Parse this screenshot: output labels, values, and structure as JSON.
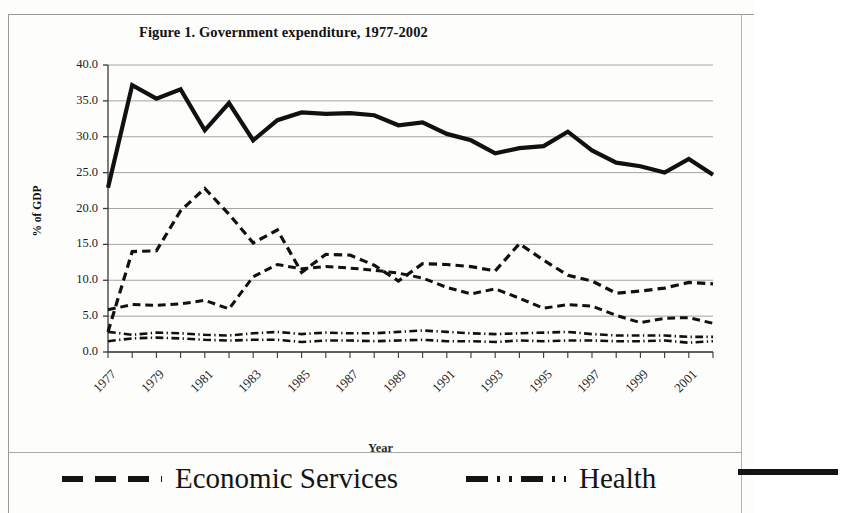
{
  "figure": {
    "title": "Figure 1. Government expenditure, 1977-2002",
    "x_axis_title": "Year",
    "y_axis_title": "% of GDP"
  },
  "legend": {
    "items": [
      {
        "label": "Economic Services",
        "dash_style": "dashed"
      },
      {
        "label": "Health",
        "dash_style": "dash-dot"
      },
      {
        "label": "",
        "dash_style": "solid"
      }
    ]
  },
  "colors": {
    "ink": "#111111",
    "gridline": "#9a9a96",
    "axis": "#3a3a3a",
    "page": "#fdfdfc"
  },
  "chart_data": {
    "type": "line",
    "title": "Figure 1. Government expenditure, 1977-2002",
    "xlabel": "Year",
    "ylabel": "% of GDP",
    "xlim": [
      1977,
      2002
    ],
    "ylim": [
      0.0,
      40.0
    ],
    "ytick_labels": [
      "0.0",
      "5.0",
      "10.0",
      "15.0",
      "20.0",
      "25.0",
      "30.0",
      "35.0",
      "40.0"
    ],
    "ytick_values": [
      0,
      5,
      10,
      15,
      20,
      25,
      30,
      35,
      40
    ],
    "xtick_labels": [
      "1977",
      "1979",
      "1981",
      "1983",
      "1985",
      "1987",
      "1989",
      "1991",
      "1993",
      "1995",
      "1997",
      "1999",
      "2001"
    ],
    "xtick_values": [
      1977,
      1979,
      1981,
      1983,
      1985,
      1987,
      1989,
      1991,
      1993,
      1995,
      1997,
      1999,
      2001
    ],
    "grid": true,
    "legend_position": "bottom",
    "x": [
      1977,
      1978,
      1979,
      1980,
      1981,
      1982,
      1983,
      1984,
      1985,
      1986,
      1987,
      1988,
      1989,
      1990,
      1991,
      1992,
      1993,
      1994,
      1995,
      1996,
      1997,
      1998,
      1999,
      2000,
      2001,
      2002
    ],
    "series": [
      {
        "name": "Total Expenditure",
        "dash_style": "solid",
        "width": 4.2,
        "values": [
          22.9,
          37.2,
          35.3,
          36.6,
          30.9,
          34.7,
          29.5,
          32.3,
          33.4,
          33.2,
          33.3,
          33.0,
          31.6,
          32.0,
          30.4,
          29.5,
          27.7,
          28.4,
          28.7,
          30.7,
          28.1,
          26.4,
          25.9,
          25.0,
          26.9,
          24.7
        ]
      },
      {
        "name": "Economic Services",
        "dash_style": "dashed",
        "width": 3.2,
        "values": [
          2.8,
          14.0,
          14.1,
          19.7,
          22.8,
          19.2,
          15.2,
          17.0,
          11.1,
          13.6,
          13.5,
          12.1,
          9.9,
          12.3,
          12.2,
          11.9,
          11.3,
          15.1,
          12.8,
          10.7,
          9.9,
          8.2,
          8.5,
          8.9,
          9.7,
          9.5
        ]
      },
      {
        "name": "Series 3",
        "dash_style": "dashed",
        "width": 3.0,
        "values": [
          5.9,
          6.6,
          6.5,
          6.7,
          7.2,
          6.0,
          10.5,
          12.2,
          11.6,
          11.9,
          11.7,
          11.4,
          11.0,
          10.3,
          9.0,
          8.1,
          8.8,
          7.5,
          6.1,
          6.6,
          6.4,
          5.1,
          4.1,
          4.7,
          4.8,
          4.0
        ]
      },
      {
        "name": "Health",
        "dash_style": "dash-dot",
        "width": 2.6,
        "values": [
          2.8,
          2.4,
          2.7,
          2.6,
          2.4,
          2.3,
          2.6,
          2.8,
          2.5,
          2.7,
          2.6,
          2.6,
          2.8,
          3.0,
          2.8,
          2.6,
          2.5,
          2.6,
          2.7,
          2.8,
          2.5,
          2.3,
          2.3,
          2.3,
          2.1,
          2.1
        ]
      },
      {
        "name": "Series 5",
        "dash_style": "dash-dot",
        "width": 2.6,
        "values": [
          1.5,
          1.9,
          2.0,
          1.9,
          1.7,
          1.6,
          1.7,
          1.7,
          1.4,
          1.6,
          1.6,
          1.5,
          1.6,
          1.7,
          1.5,
          1.5,
          1.4,
          1.6,
          1.5,
          1.6,
          1.6,
          1.5,
          1.5,
          1.6,
          1.3,
          1.5
        ]
      }
    ]
  }
}
